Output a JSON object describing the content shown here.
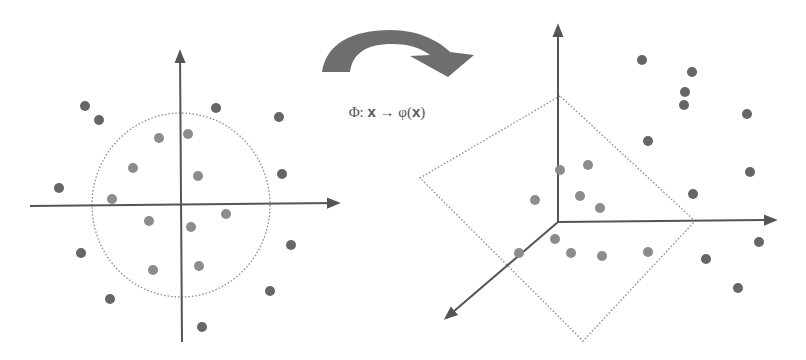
{
  "mapping_label": {
    "phi": "Φ",
    "colon": ": ",
    "x": "x",
    "arrow": " → ",
    "varphi": "φ(",
    "x2": "x",
    "close": ")"
  },
  "colors": {
    "axis": "#555555",
    "outer_point": "#666666",
    "inner_point": "#8c8c8c",
    "boundary": "#8a8a8a",
    "curved_arrow": "#6e6e6e"
  },
  "left_plot": {
    "name": "input-space-2d",
    "origin": [
      181,
      205
    ],
    "boundary": {
      "type": "circle",
      "cx": 181,
      "cy": 205,
      "rx": 89,
      "ry": 92
    },
    "outer_points": [
      [
        85,
        106
      ],
      [
        99,
        120
      ],
      [
        216,
        108
      ],
      [
        279,
        117
      ],
      [
        59,
        188
      ],
      [
        282,
        174
      ],
      [
        81,
        253
      ],
      [
        291,
        245
      ],
      [
        110,
        299
      ],
      [
        270,
        291
      ],
      [
        202,
        327
      ]
    ],
    "inner_points": [
      [
        159,
        138
      ],
      [
        188,
        134
      ],
      [
        133,
        168
      ],
      [
        198,
        176
      ],
      [
        112,
        199
      ],
      [
        149,
        221
      ],
      [
        191,
        227
      ],
      [
        226,
        214
      ],
      [
        153,
        270
      ],
      [
        199,
        266
      ]
    ]
  },
  "right_plot": {
    "name": "feature-space-3d",
    "origin": [
      558,
      221
    ],
    "boundary": {
      "type": "plane",
      "corners": [
        [
          560,
          96
        ],
        [
          420,
          178
        ],
        [
          583,
          341
        ],
        [
          695,
          221
        ]
      ]
    },
    "outer_points": [
      [
        642,
        60
      ],
      [
        692,
        72
      ],
      [
        685,
        92
      ],
      [
        684,
        105
      ],
      [
        747,
        114
      ],
      [
        648,
        141
      ],
      [
        750,
        172
      ],
      [
        693,
        194
      ],
      [
        759,
        242
      ],
      [
        706,
        259
      ],
      [
        738,
        288
      ]
    ],
    "inner_points": [
      [
        560,
        170
      ],
      [
        588,
        165
      ],
      [
        535,
        200
      ],
      [
        580,
        196
      ],
      [
        600,
        208
      ],
      [
        555,
        239
      ],
      [
        519,
        253
      ],
      [
        571,
        253
      ],
      [
        602,
        256
      ],
      [
        648,
        252
      ]
    ]
  }
}
